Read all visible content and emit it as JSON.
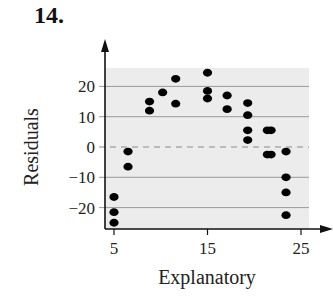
{
  "problem_number": "14.",
  "colors": {
    "plot_background": "#ececec",
    "gridline": "#9a9a9a",
    "zero_line": "#8a8a8a",
    "axis": "#111111",
    "point": "#000000"
  },
  "chart_data": {
    "type": "scatter",
    "title": "",
    "xlabel": "Explanatory",
    "ylabel": "Residuals",
    "xlim": [
      4,
      26
    ],
    "ylim": [
      -27,
      26
    ],
    "x_ticks": [
      5,
      15,
      25
    ],
    "x_tick_labels": [
      "5",
      "15",
      "25"
    ],
    "y_ticks": [
      -20,
      -10,
      0,
      10,
      20
    ],
    "y_tick_labels": [
      "−20",
      "−10",
      "0",
      "10",
      "20"
    ],
    "grid": "horizontal gridlines at y ticks; dashed reference line at y=0",
    "legend": null,
    "points": [
      {
        "x": 5.0,
        "y": -16.5
      },
      {
        "x": 5.0,
        "y": -21.5
      },
      {
        "x": 5.0,
        "y": -25.0
      },
      {
        "x": 6.5,
        "y": -1.5
      },
      {
        "x": 6.5,
        "y": -6.5
      },
      {
        "x": 8.8,
        "y": 15.0
      },
      {
        "x": 8.8,
        "y": 12.0
      },
      {
        "x": 10.2,
        "y": 18.0
      },
      {
        "x": 11.6,
        "y": 22.5
      },
      {
        "x": 11.6,
        "y": 14.3
      },
      {
        "x": 15.0,
        "y": 24.5
      },
      {
        "x": 15.0,
        "y": 18.5
      },
      {
        "x": 15.0,
        "y": 16.0
      },
      {
        "x": 17.1,
        "y": 17.0
      },
      {
        "x": 17.1,
        "y": 12.5
      },
      {
        "x": 19.3,
        "y": 14.5
      },
      {
        "x": 19.3,
        "y": 10.5
      },
      {
        "x": 19.3,
        "y": 5.5
      },
      {
        "x": 19.3,
        "y": 2.3
      },
      {
        "x": 21.4,
        "y": 5.5
      },
      {
        "x": 21.8,
        "y": 5.5
      },
      {
        "x": 21.4,
        "y": -2.5
      },
      {
        "x": 21.8,
        "y": -2.5
      },
      {
        "x": 23.4,
        "y": -1.5
      },
      {
        "x": 23.4,
        "y": -10.0
      },
      {
        "x": 23.4,
        "y": -15.0
      },
      {
        "x": 23.4,
        "y": -22.5
      }
    ]
  }
}
